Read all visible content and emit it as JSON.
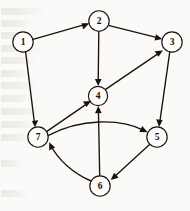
{
  "figure": {
    "type": "directed-graph",
    "background_color": "#fbfaf8",
    "ink_color": "#17140f",
    "node_fill": "#fdfcfa",
    "node_radius": 10,
    "width": 190,
    "height": 211
  },
  "nodes": [
    {
      "id": "1",
      "label": "1",
      "x": 23,
      "y": 42
    },
    {
      "id": "2",
      "label": "2",
      "x": 99,
      "y": 21
    },
    {
      "id": "3",
      "label": "3",
      "x": 172,
      "y": 42
    },
    {
      "id": "4",
      "label": "4",
      "x": 98,
      "y": 96
    },
    {
      "id": "5",
      "label": "5",
      "x": 157,
      "y": 137
    },
    {
      "id": "6",
      "label": "6",
      "x": 100,
      "y": 186
    },
    {
      "id": "7",
      "label": "7",
      "x": 38,
      "y": 137
    }
  ],
  "edges": [
    {
      "from": "1",
      "to": "2",
      "shape": "straight",
      "directed": true
    },
    {
      "from": "1",
      "to": "7",
      "shape": "straight",
      "directed": true
    },
    {
      "from": "2",
      "to": "3",
      "shape": "straight",
      "directed": true
    },
    {
      "from": "2",
      "to": "4",
      "shape": "straight",
      "directed": true
    },
    {
      "from": "4",
      "to": "3",
      "shape": "straight",
      "directed": true
    },
    {
      "from": "3",
      "to": "5",
      "shape": "straight",
      "directed": true
    },
    {
      "from": "7",
      "to": "4",
      "shape": "straight",
      "directed": true
    },
    {
      "from": "7",
      "to": "5",
      "shape": "curved",
      "curve": "arc-above",
      "directed": true
    },
    {
      "from": "6",
      "to": "4",
      "shape": "straight",
      "directed": true
    },
    {
      "from": "6",
      "to": "7",
      "shape": "curved",
      "curve": "arc-left",
      "directed": true
    },
    {
      "from": "5",
      "to": "6",
      "shape": "straight",
      "directed": true
    }
  ],
  "ghost_text_lines": [
    {
      "top": 8,
      "width": 46
    },
    {
      "top": 20,
      "width": 34
    },
    {
      "top": 32,
      "width": 40
    },
    {
      "top": 45,
      "width": 44
    },
    {
      "top": 57,
      "width": 38
    },
    {
      "top": 70,
      "width": 30
    },
    {
      "top": 82,
      "width": 36
    },
    {
      "top": 95,
      "width": 33
    },
    {
      "top": 108,
      "width": 42
    },
    {
      "top": 121,
      "width": 37
    },
    {
      "top": 134,
      "width": 31
    },
    {
      "top": 160,
      "width": 22
    },
    {
      "top": 190,
      "width": 28
    }
  ]
}
